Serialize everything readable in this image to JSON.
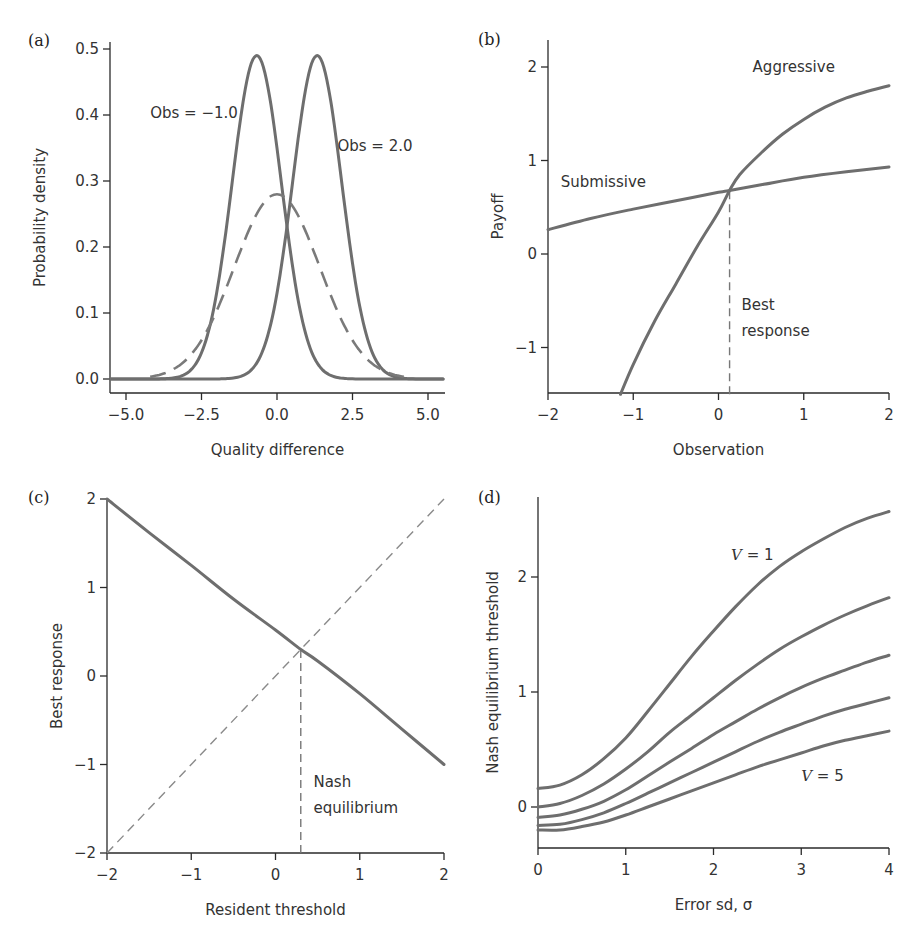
{
  "figure": {
    "panels": [
      "(a)",
      "(b)",
      "(c)",
      "(d)"
    ]
  },
  "chart_data": [
    {
      "id": "a",
      "panel_label": "(a)",
      "type": "line",
      "title": "",
      "xlabel": "Quality difference",
      "ylabel": "Probability density",
      "xlim": [
        -5.5,
        5.5
      ],
      "ylim": [
        0.0,
        0.5
      ],
      "xticks": [
        -5.0,
        -2.5,
        0.0,
        2.5,
        5.0
      ],
      "xtick_labels": [
        "−5.0",
        "−2.5",
        "0.0",
        "2.5",
        "5.0"
      ],
      "yticks": [
        0.0,
        0.1,
        0.2,
        0.3,
        0.4,
        0.5
      ],
      "ytick_labels": [
        "0.0",
        "0.1",
        "0.2",
        "0.3",
        "0.4",
        "0.5"
      ],
      "grid": false,
      "series": [
        {
          "name": "Obs = −1.0",
          "style": "solid",
          "distribution": "normal",
          "mean": -0.67,
          "sd": 0.816,
          "peak": 0.49
        },
        {
          "name": "Obs = 2.0",
          "style": "solid",
          "distribution": "normal",
          "mean": 1.33,
          "sd": 0.816,
          "peak": 0.49
        },
        {
          "name": "Prior",
          "style": "dashed",
          "distribution": "normal",
          "mean": 0.0,
          "sd": 1.414,
          "peak": 0.28
        }
      ],
      "annotations": [
        {
          "text": "Obs = −1.0",
          "x": -4.2,
          "y": 0.395
        },
        {
          "text": "Obs = 2.0",
          "x": 2.0,
          "y": 0.345
        }
      ]
    },
    {
      "id": "b",
      "panel_label": "(b)",
      "type": "line",
      "title": "",
      "xlabel": "Observation",
      "ylabel": "Payoff",
      "xlim": [
        -2,
        2
      ],
      "ylim": [
        -1.5,
        2.3
      ],
      "xticks": [
        -2,
        -1,
        0,
        1,
        2
      ],
      "xtick_labels": [
        "−2",
        "−1",
        "0",
        "1",
        "2"
      ],
      "yticks": [
        -1,
        0,
        1,
        2
      ],
      "ytick_labels": [
        "−1",
        "0",
        "1",
        "2"
      ],
      "grid": false,
      "series": [
        {
          "name": "Aggressive",
          "style": "solid",
          "x": [
            -1.15,
            -1.0,
            -0.75,
            -0.5,
            -0.25,
            0.0,
            0.13,
            0.25,
            0.5,
            0.75,
            1.0,
            1.25,
            1.5,
            1.75,
            2.0
          ],
          "y": [
            -1.5,
            -1.18,
            -0.72,
            -0.32,
            0.08,
            0.45,
            0.68,
            0.85,
            1.08,
            1.28,
            1.44,
            1.57,
            1.67,
            1.74,
            1.8
          ]
        },
        {
          "name": "Submissive",
          "style": "solid",
          "x": [
            -2.0,
            -1.5,
            -1.0,
            -0.5,
            0.0,
            0.13,
            0.5,
            1.0,
            1.5,
            2.0
          ],
          "y": [
            0.26,
            0.38,
            0.48,
            0.57,
            0.66,
            0.68,
            0.74,
            0.82,
            0.88,
            0.93
          ]
        }
      ],
      "reference_lines": [
        {
          "type": "vertical",
          "style": "dashed",
          "x": 0.13,
          "y_from": -1.5,
          "y_to": 0.68
        }
      ],
      "annotations": [
        {
          "text": "Aggressive",
          "x": 0.4,
          "y": 1.95
        },
        {
          "text": "Submissive",
          "x": -1.85,
          "y": 0.72
        },
        {
          "text": "Best",
          "x": 0.27,
          "y": -0.6
        },
        {
          "text": "response",
          "x": 0.27,
          "y": -0.88
        }
      ]
    },
    {
      "id": "c",
      "panel_label": "(c)",
      "type": "line",
      "title": "",
      "xlabel": "Resident threshold",
      "ylabel": "Best response",
      "xlim": [
        -2,
        2
      ],
      "ylim": [
        -2,
        2
      ],
      "xticks": [
        -2,
        -1,
        0,
        1,
        2
      ],
      "xtick_labels": [
        "−2",
        "−1",
        "0",
        "1",
        "2"
      ],
      "yticks": [
        -2,
        -1,
        0,
        1,
        2
      ],
      "ytick_labels": [
        "−2",
        "−1",
        "0",
        "1",
        "2"
      ],
      "grid": false,
      "series": [
        {
          "name": "Best response",
          "style": "solid",
          "x": [
            -2.0,
            -1.5,
            -1.0,
            -0.5,
            0.0,
            0.3,
            0.5,
            1.0,
            1.5,
            2.0
          ],
          "y": [
            2.0,
            1.62,
            1.25,
            0.87,
            0.52,
            0.3,
            0.17,
            -0.2,
            -0.6,
            -1.0
          ]
        },
        {
          "name": "Diagonal (y = x)",
          "style": "dashed",
          "x": [
            -2,
            2
          ],
          "y": [
            -2,
            2
          ]
        }
      ],
      "reference_lines": [
        {
          "type": "vertical",
          "style": "dashed",
          "x": 0.3,
          "y_from": -2,
          "y_to": 0.3
        }
      ],
      "annotations": [
        {
          "text": "Nash",
          "x": 0.45,
          "y": -1.25
        },
        {
          "text": "equilibrium",
          "x": 0.45,
          "y": -1.55
        }
      ]
    },
    {
      "id": "d",
      "panel_label": "(d)",
      "type": "line",
      "title": "",
      "xlabel": "Error sd, σ",
      "ylabel": "Nash equilibrium threshold",
      "xlim": [
        0,
        4
      ],
      "ylim": [
        -0.35,
        2.7
      ],
      "xticks": [
        0,
        1,
        2,
        3,
        4
      ],
      "xtick_labels": [
        "0",
        "1",
        "2",
        "3",
        "4"
      ],
      "yticks": [
        0,
        1,
        2
      ],
      "ytick_labels": [
        "0",
        "1",
        "2"
      ],
      "grid": false,
      "series": [
        {
          "name": "V = 1",
          "style": "solid",
          "x": [
            0,
            0.25,
            0.5,
            0.75,
            1.0,
            1.25,
            1.5,
            1.75,
            2.0,
            2.25,
            2.5,
            2.75,
            3.0,
            3.25,
            3.5,
            3.75,
            4.0
          ],
          "y": [
            0.16,
            0.19,
            0.28,
            0.42,
            0.6,
            0.83,
            1.07,
            1.31,
            1.53,
            1.74,
            1.93,
            2.09,
            2.22,
            2.33,
            2.43,
            2.51,
            2.57
          ]
        },
        {
          "name": "V = 2",
          "style": "solid",
          "x": [
            0,
            0.25,
            0.5,
            0.75,
            1.0,
            1.25,
            1.5,
            1.75,
            2.0,
            2.25,
            2.5,
            2.75,
            3.0,
            3.25,
            3.5,
            3.75,
            4.0
          ],
          "y": [
            0.0,
            0.03,
            0.1,
            0.2,
            0.33,
            0.48,
            0.65,
            0.8,
            0.95,
            1.1,
            1.24,
            1.37,
            1.48,
            1.58,
            1.67,
            1.75,
            1.82
          ]
        },
        {
          "name": "V = 3",
          "style": "solid",
          "x": [
            0,
            0.25,
            0.5,
            0.75,
            1.0,
            1.25,
            1.5,
            1.75,
            2.0,
            2.25,
            2.5,
            2.75,
            3.0,
            3.25,
            3.5,
            3.75,
            4.0
          ],
          "y": [
            -0.09,
            -0.07,
            -0.02,
            0.05,
            0.15,
            0.27,
            0.39,
            0.51,
            0.63,
            0.74,
            0.85,
            0.95,
            1.04,
            1.12,
            1.19,
            1.26,
            1.32
          ]
        },
        {
          "name": "V = 4",
          "style": "solid",
          "x": [
            0,
            0.25,
            0.5,
            0.75,
            1.0,
            1.25,
            1.5,
            1.75,
            2.0,
            2.25,
            2.5,
            2.75,
            3.0,
            3.25,
            3.5,
            3.75,
            4.0
          ],
          "y": [
            -0.16,
            -0.15,
            -0.11,
            -0.05,
            0.03,
            0.12,
            0.21,
            0.3,
            0.39,
            0.48,
            0.57,
            0.65,
            0.72,
            0.79,
            0.85,
            0.9,
            0.95
          ]
        },
        {
          "name": "V = 5",
          "style": "solid",
          "x": [
            0,
            0.25,
            0.5,
            0.75,
            1.0,
            1.25,
            1.5,
            1.75,
            2.0,
            2.25,
            2.5,
            2.75,
            3.0,
            3.25,
            3.5,
            3.75,
            4.0
          ],
          "y": [
            -0.2,
            -0.2,
            -0.17,
            -0.13,
            -0.07,
            0.0,
            0.07,
            0.14,
            0.21,
            0.28,
            0.35,
            0.41,
            0.47,
            0.53,
            0.58,
            0.62,
            0.66
          ]
        }
      ],
      "annotations": [
        {
          "text": "V = 1",
          "x": 2.2,
          "y": 2.15
        },
        {
          "text": "V = 5",
          "x": 3.0,
          "y": 0.23
        }
      ]
    }
  ],
  "layout": {
    "panels": {
      "a": {
        "ox": 110,
        "x0": 126,
        "x1": 428,
        "xv0": -5.0,
        "xv1": 5.0,
        "yaxis_y0": 379,
        "yaxis_y1": 49,
        "yv0": 0.0,
        "yv1": 0.5,
        "xaxis_y": 393,
        "top": 42,
        "right": 445,
        "label_x": 28,
        "label_y": 46
      },
      "b": {
        "ox": 548,
        "x0": 548,
        "x1": 889,
        "xv0": -2,
        "xv1": 2,
        "yaxis_y0": 254,
        "yaxis_y1": 67,
        "yv0": 0,
        "yv1": 2,
        "xaxis_y": 393,
        "top": 40,
        "right": 889,
        "label_x": 478,
        "label_y": 45
      },
      "c": {
        "ox": 107,
        "x0": 107,
        "x1": 444,
        "xv0": -2,
        "xv1": 2,
        "yaxis_y0": 853,
        "yaxis_y1": 499,
        "yv0": -2,
        "yv1": 2,
        "xaxis_y": 853,
        "top": 499,
        "right": 444,
        "label_x": 28,
        "label_y": 503
      },
      "d": {
        "ox": 538,
        "x0": 538,
        "x1": 889,
        "xv0": 0,
        "xv1": 4,
        "yaxis_y0": 807,
        "yaxis_y1": 577,
        "yv0": 0,
        "yv1": 2,
        "xaxis_y": 848,
        "top": 497,
        "right": 889,
        "label_x": 478,
        "label_y": 503
      }
    }
  }
}
